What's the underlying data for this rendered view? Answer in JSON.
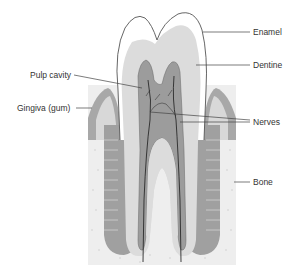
{
  "diagram": {
    "type": "anatomical-cross-section",
    "colors": {
      "background": "#ffffff",
      "enamel": "#ffffff",
      "enamel_outline": "#555555",
      "dentine": "#dcdcdc",
      "pulp": "#9c9c9c",
      "nerve": "#2a2a2a",
      "gum": "#a8a8a8",
      "gum_light": "#d8d8d8",
      "bone": "#eeeeee",
      "periodontal": "#a0a0a0",
      "leader_line": "#444444",
      "label_text": "#333333"
    },
    "labels": [
      {
        "id": "enamel",
        "text": "Enamel",
        "side": "right"
      },
      {
        "id": "dentine",
        "text": "Dentine",
        "side": "right"
      },
      {
        "id": "pulp-cavity",
        "text": "Pulp cavity",
        "side": "left"
      },
      {
        "id": "gingiva",
        "text": "Gingiva (gum)",
        "side": "left"
      },
      {
        "id": "nerves",
        "text": "Nerves",
        "side": "right"
      },
      {
        "id": "bone",
        "text": "Bone",
        "side": "right"
      }
    ]
  }
}
